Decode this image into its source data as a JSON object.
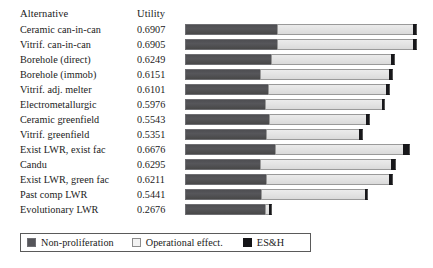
{
  "header": {
    "alternative_label": "Alternative",
    "utility_label": "Utility"
  },
  "legend": {
    "items": [
      {
        "name": "non-proliferation",
        "label": "Non-proliferation",
        "color": "#55555a"
      },
      {
        "name": "operational-effect",
        "label": "Operational effect.",
        "color": "#f2f2f2"
      },
      {
        "name": "es-and-h",
        "label": "ES&H",
        "color": "#151518"
      }
    ]
  },
  "chart_data": {
    "type": "bar",
    "orientation": "horizontal",
    "stacked": true,
    "title": "",
    "xlabel": "",
    "ylabel": "Alternative",
    "grid": false,
    "legend_position": "bottom-left",
    "xlim": [
      0,
      0.72
    ],
    "categories": [
      "Ceramic can-in-can",
      "Vitrif. can-in-can",
      "Borehole (direct)",
      "Borehole (immob)",
      "Vitrif. adj. melter",
      "Electrometallurgic",
      "Ceramic greenfield",
      "Vitrif. greenfield",
      "Exist LWR, exist fac",
      "Candu",
      "Exist LWR, green fac",
      "Past comp LWR",
      "Evolutionary LWR"
    ],
    "totals": [
      0.6907,
      0.6905,
      0.6249,
      0.6151,
      0.6101,
      0.5976,
      0.5543,
      0.5351,
      0.6676,
      0.6295,
      0.6211,
      0.5441,
      0.2676
    ],
    "totals_text": [
      "0.6907",
      "0.6905",
      "0.6249",
      "0.6151",
      "0.6101",
      "0.5976",
      "0.5543",
      "0.5351",
      "0.6676",
      "0.6295",
      "0.6211",
      "0.5441",
      "0.2676"
    ],
    "series": [
      {
        "name": "Non-proliferation",
        "values": [
          0.2727,
          0.2727,
          0.2546,
          0.2212,
          0.2471,
          0.2374,
          0.2495,
          0.2407,
          0.2671,
          0.2212,
          0.2405,
          0.2245,
          0.2374
        ]
      },
      {
        "name": "Operational effect.",
        "values": [
          0.406,
          0.4058,
          0.3595,
          0.3841,
          0.3534,
          0.3506,
          0.2935,
          0.2825,
          0.3808,
          0.3935,
          0.3678,
          0.3118,
          0.0204
        ]
      },
      {
        "name": "ES&H",
        "values": [
          0.012,
          0.012,
          0.0108,
          0.0098,
          0.0096,
          0.0096,
          0.0113,
          0.0119,
          0.0197,
          0.0148,
          0.0128,
          0.0078,
          0.0098
        ]
      }
    ],
    "bar_geometry_px": {
      "axis_left": 185,
      "scale_px_per_unit": 336,
      "rows": [
        {
          "np": 92,
          "op": 136,
          "esh": 4
        },
        {
          "np": 92,
          "op": 136,
          "esh": 4
        },
        {
          "np": 86,
          "op": 120,
          "esh": 4
        },
        {
          "np": 75,
          "op": 129,
          "esh": 4
        },
        {
          "np": 83,
          "op": 118,
          "esh": 4
        },
        {
          "np": 80,
          "op": 117,
          "esh": 3
        },
        {
          "np": 84,
          "op": 97,
          "esh": 4
        },
        {
          "np": 81,
          "op": 93,
          "esh": 4
        },
        {
          "np": 90,
          "op": 128,
          "esh": 7
        },
        {
          "np": 75,
          "op": 131,
          "esh": 5
        },
        {
          "np": 81,
          "op": 123,
          "esh": 4
        },
        {
          "np": 76,
          "op": 104,
          "esh": 3
        },
        {
          "np": 80,
          "op": 4,
          "esh": 3
        }
      ]
    }
  }
}
